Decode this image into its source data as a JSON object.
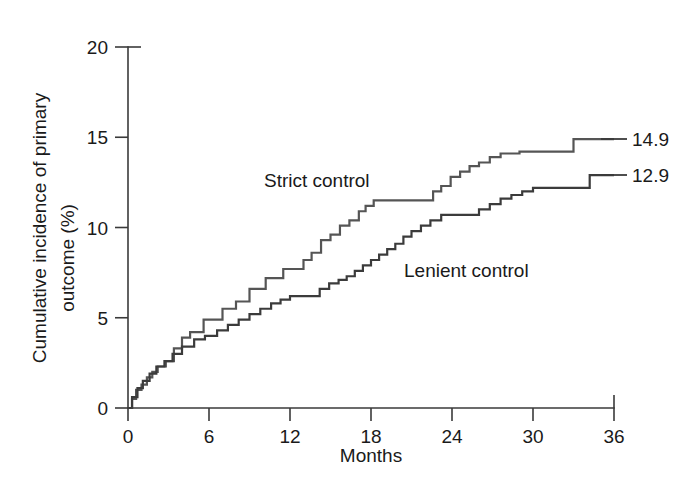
{
  "chart_data": {
    "type": "line",
    "subtype": "kaplan-meier-cumulative-incidence-step",
    "title": "",
    "xlabel": "Months",
    "ylabel_line1": "Cumulative incidence of primary",
    "ylabel_line2": "outcome (%)",
    "xlim": [
      0,
      36
    ],
    "ylim": [
      0,
      20
    ],
    "xticks": [
      0,
      6,
      12,
      18,
      24,
      30,
      36
    ],
    "xtick_labels": [
      "0",
      "6",
      "12",
      "18",
      "24",
      "30",
      "36"
    ],
    "yticks": [
      0,
      5,
      10,
      15,
      20
    ],
    "ytick_labels": [
      "0",
      "5",
      "10",
      "15",
      "20"
    ],
    "grid": false,
    "legend_position": "inline-annotation",
    "series": [
      {
        "name": "Strict control",
        "color": "#555555",
        "final_value": 14.9,
        "final_value_label": "14.9",
        "annotation": "Strict control",
        "annotation_x": 14.0,
        "annotation_y": 11.6,
        "x": [
          0,
          0.3,
          0.6,
          1.0,
          1.4,
          1.8,
          2.2,
          2.8,
          3.4,
          4.0,
          4.6,
          5.6,
          7.0,
          8.0,
          9.0,
          10.2,
          11.5,
          12.4,
          13.0,
          13.6,
          14.3,
          15.0,
          15.7,
          16.4,
          17.1,
          17.6,
          18.2,
          22.0,
          22.6,
          23.2,
          23.9,
          24.6,
          25.3,
          26.0,
          26.8,
          27.6,
          29.0,
          32.2,
          33.0,
          36.0
        ],
        "y": [
          0,
          0.5,
          1.0,
          1.3,
          1.7,
          2.0,
          2.3,
          2.6,
          3.3,
          3.9,
          4.2,
          4.9,
          5.5,
          5.9,
          6.6,
          7.2,
          7.7,
          7.7,
          8.2,
          8.6,
          9.3,
          9.6,
          10.1,
          10.4,
          10.9,
          11.2,
          11.5,
          11.5,
          12.0,
          12.3,
          12.8,
          13.1,
          13.4,
          13.6,
          13.9,
          14.1,
          14.2,
          14.2,
          14.9,
          14.9
        ]
      },
      {
        "name": "Lenient control",
        "color": "#3b3b3b",
        "final_value": 12.9,
        "final_value_label": "12.9",
        "annotation": "Lenient control",
        "annotation_x": 21.5,
        "annotation_y": 8.3,
        "x": [
          0,
          0.3,
          0.7,
          1.1,
          1.6,
          2.1,
          2.7,
          3.3,
          4.0,
          4.9,
          5.7,
          6.6,
          7.4,
          8.2,
          9.0,
          9.8,
          10.6,
          11.3,
          12.0,
          13.5,
          14.2,
          14.9,
          15.6,
          16.2,
          16.8,
          17.4,
          18.0,
          18.6,
          19.2,
          19.8,
          20.4,
          21.0,
          21.7,
          22.4,
          23.2,
          25.0,
          26.0,
          26.8,
          27.6,
          28.4,
          29.2,
          30.0,
          33.2,
          34.2,
          36.0
        ],
        "y": [
          0,
          0.6,
          1.1,
          1.5,
          1.9,
          2.3,
          2.6,
          3.0,
          3.4,
          3.8,
          4.0,
          4.3,
          4.6,
          4.9,
          5.2,
          5.5,
          5.8,
          6.0,
          6.2,
          6.2,
          6.6,
          6.9,
          7.1,
          7.3,
          7.6,
          7.9,
          8.2,
          8.5,
          8.8,
          9.1,
          9.5,
          9.8,
          10.1,
          10.4,
          10.7,
          10.7,
          11.0,
          11.3,
          11.6,
          11.8,
          12.0,
          12.2,
          12.2,
          12.9,
          12.9
        ]
      }
    ]
  },
  "axes": {
    "y_label_line1": "Cumulative incidence of primary",
    "y_label_line2": "outcome (%)",
    "x_label": "Months"
  },
  "annotations": {
    "strict_label": "Strict control",
    "lenient_label": "Lenient control",
    "strict_end": "14.9",
    "lenient_end": "12.9"
  },
  "colors": {
    "axis": "#3a3a3a",
    "strict": "#555555",
    "lenient": "#3b3b3b",
    "text": "#1a1a1a",
    "background": "#ffffff"
  }
}
